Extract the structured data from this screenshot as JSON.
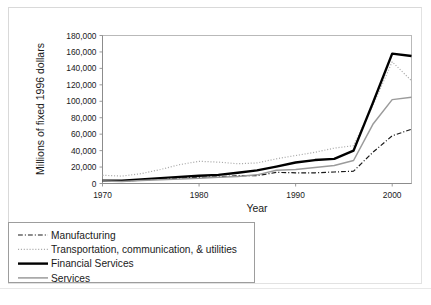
{
  "chart_data": {
    "type": "line",
    "title": "",
    "xlabel": "Year",
    "ylabel": "Millions of fixed 1996 dollars",
    "xlim": [
      1970,
      2002
    ],
    "ylim": [
      0,
      180000
    ],
    "xticks": [
      "1970",
      "1980",
      "1990",
      "2000"
    ],
    "xtick_values": [
      1970,
      1980,
      1990,
      2000
    ],
    "yticks": [
      "0",
      "20,000",
      "40,000",
      "60,000",
      "80,000",
      "100,000",
      "120,000",
      "140,000",
      "160,000",
      "180,000"
    ],
    "ytick_values": [
      0,
      20000,
      40000,
      60000,
      80000,
      100000,
      120000,
      140000,
      160000,
      180000
    ],
    "grid": false,
    "legend_position": "below-left",
    "x": [
      1970,
      1972,
      1974,
      1976,
      1978,
      1980,
      1982,
      1984,
      1986,
      1988,
      1990,
      1992,
      1994,
      1996,
      1998,
      2000,
      2002
    ],
    "series": [
      {
        "name": "Manufacturing",
        "style": "dash-dot",
        "color": "#1a1a1a",
        "width": 1.2,
        "values": [
          3000,
          3000,
          4000,
          5500,
          6500,
          7500,
          8000,
          9500,
          9500,
          13500,
          13000,
          13000,
          14000,
          15000,
          38000,
          58000,
          66000
        ]
      },
      {
        "name": "Transportation, communication, & utilities",
        "style": "dotted",
        "color": "#aaaaaa",
        "width": 1.2,
        "values": [
          10000,
          9000,
          12000,
          17000,
          23000,
          27000,
          26000,
          24000,
          25000,
          30000,
          34000,
          38000,
          43000,
          46000,
          95000,
          148000,
          125000
        ]
      },
      {
        "name": "Financial Services",
        "style": "solid",
        "color": "#000000",
        "width": 2.4,
        "values": [
          3500,
          3500,
          5000,
          6500,
          8000,
          9500,
          10500,
          13000,
          16000,
          20500,
          25500,
          28500,
          30000,
          40000,
          98000,
          158000,
          155000
        ]
      },
      {
        "name": "Services",
        "style": "solid",
        "color": "#9b9b9b",
        "width": 1.5,
        "values": [
          3000,
          2500,
          3500,
          4500,
          5500,
          6500,
          7500,
          8500,
          10500,
          16000,
          17000,
          19500,
          22000,
          28000,
          72000,
          102000,
          105000
        ]
      }
    ]
  },
  "legend": {
    "entries": [
      {
        "label": "Manufacturing"
      },
      {
        "label": "Transportation, communication, & utilities"
      },
      {
        "label": "Financial Services"
      },
      {
        "label": "Services"
      }
    ]
  }
}
